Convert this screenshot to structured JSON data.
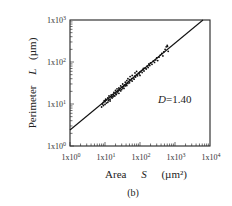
{
  "chart_data": {
    "type": "scatter",
    "title": "",
    "panel_label": "(b)",
    "xlabel": "Area  S  (µm²)",
    "xlabel_parts": {
      "name": "Area",
      "symbol": "S",
      "unit": "(µm²)"
    },
    "ylabel": "Perimeter  L  (µm)",
    "ylabel_parts": {
      "name": "Perimeter",
      "symbol": "L",
      "unit": "(µm)"
    },
    "xscale": "log",
    "yscale": "log",
    "xlim": [
      1,
      10000
    ],
    "ylim": [
      1,
      1000
    ],
    "x_ticks": [
      {
        "value": 1,
        "label": "1x10",
        "exp": "0"
      },
      {
        "value": 10,
        "label": "1x10",
        "exp": "1"
      },
      {
        "value": 100,
        "label": "1x10",
        "exp": "2"
      },
      {
        "value": 1000,
        "label": "1x10",
        "exp": "3"
      },
      {
        "value": 10000,
        "label": "1x10",
        "exp": "4"
      }
    ],
    "y_ticks": [
      {
        "value": 1,
        "label": "1x10",
        "exp": "0"
      },
      {
        "value": 10,
        "label": "1x10",
        "exp": "1"
      },
      {
        "value": 100,
        "label": "1x10",
        "exp": "2"
      },
      {
        "value": 1000,
        "label": "1x10",
        "exp": "3"
      }
    ],
    "grid": false,
    "legend": null,
    "annotation": {
      "text": "D=1.40",
      "position": [
        900,
        14
      ]
    },
    "fit_line": {
      "form": "L = k * S^(D/2)",
      "D": 1.4,
      "points": [
        [
          1,
          2.4
        ],
        [
          6300,
          1000
        ]
      ]
    },
    "series": [
      {
        "name": "particles",
        "marker": "dot",
        "points": [
          [
            8,
            8.5
          ],
          [
            8.5,
            10
          ],
          [
            9,
            9.2
          ],
          [
            9,
            11
          ],
          [
            9.5,
            12
          ],
          [
            10,
            9.8
          ],
          [
            10,
            11.5
          ],
          [
            10.5,
            13
          ],
          [
            11,
            10.5
          ],
          [
            11,
            12.5
          ],
          [
            12,
            11
          ],
          [
            12,
            14
          ],
          [
            12.5,
            12
          ],
          [
            13,
            12.8
          ],
          [
            13,
            15.5
          ],
          [
            14,
            13
          ],
          [
            14,
            11.8
          ],
          [
            15,
            14.5
          ],
          [
            15,
            16.5
          ],
          [
            16,
            13.8
          ],
          [
            16,
            15
          ],
          [
            17,
            17
          ],
          [
            17,
            14.8
          ],
          [
            18,
            16
          ],
          [
            18,
            19
          ],
          [
            19,
            15.5
          ],
          [
            20,
            17.5
          ],
          [
            20,
            21
          ],
          [
            21,
            16.8
          ],
          [
            22,
            18.5
          ],
          [
            22,
            23
          ],
          [
            23,
            19.5
          ],
          [
            24,
            20.5
          ],
          [
            25,
            18
          ],
          [
            25,
            24
          ],
          [
            26,
            21.5
          ],
          [
            27,
            23
          ],
          [
            28,
            20.5
          ],
          [
            28,
            27
          ],
          [
            30,
            22
          ],
          [
            30,
            25
          ],
          [
            32,
            24
          ],
          [
            32,
            30
          ],
          [
            34,
            26
          ],
          [
            35,
            23.5
          ],
          [
            36,
            28
          ],
          [
            38,
            27
          ],
          [
            38,
            33
          ],
          [
            40,
            29
          ],
          [
            42,
            27.5
          ],
          [
            42,
            36
          ],
          [
            45,
            31
          ],
          [
            45,
            40
          ],
          [
            48,
            34
          ],
          [
            50,
            32
          ],
          [
            50,
            38
          ],
          [
            52,
            45
          ],
          [
            55,
            36
          ],
          [
            58,
            40
          ],
          [
            60,
            35
          ],
          [
            60,
            48
          ],
          [
            65,
            42
          ],
          [
            68,
            39
          ],
          [
            70,
            46
          ],
          [
            72,
            55
          ],
          [
            75,
            44
          ],
          [
            80,
            50
          ],
          [
            80,
            60
          ],
          [
            85,
            47
          ],
          [
            90,
            54
          ],
          [
            95,
            52
          ],
          [
            100,
            58
          ],
          [
            100,
            48
          ],
          [
            110,
            62
          ],
          [
            115,
            56
          ],
          [
            120,
            66
          ],
          [
            125,
            70
          ],
          [
            130,
            61
          ],
          [
            140,
            72
          ],
          [
            150,
            68
          ],
          [
            160,
            80
          ],
          [
            170,
            74
          ],
          [
            180,
            90
          ],
          [
            190,
            82
          ],
          [
            200,
            95
          ],
          [
            220,
            88
          ],
          [
            240,
            105
          ],
          [
            260,
            98
          ],
          [
            280,
            112
          ],
          [
            300,
            125
          ],
          [
            320,
            108
          ],
          [
            350,
            130
          ],
          [
            380,
            145
          ],
          [
            420,
            160
          ],
          [
            450,
            140
          ],
          [
            480,
            175
          ],
          [
            520,
            200
          ],
          [
            560,
            230
          ],
          [
            600,
            250
          ],
          [
            610,
            235
          ],
          [
            640,
            180
          ]
        ]
      }
    ]
  }
}
